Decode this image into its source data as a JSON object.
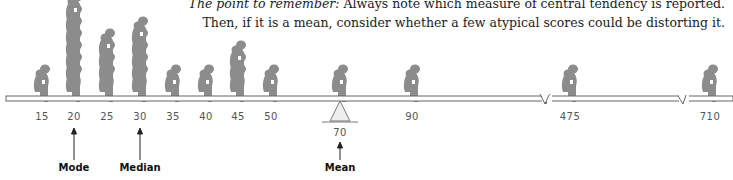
{
  "caption": {
    "line1_lead": "The point to remember:",
    "line1_rest": " Always note which measure of central tendency is reported.",
    "line2": "Then, if it is a mean, consider whether a few atypical scores could be distorting it."
  },
  "markers": {
    "mode": {
      "label": "Mode",
      "value": "20"
    },
    "median": {
      "label": "Median",
      "value": "30"
    },
    "mean": {
      "label": "Mean",
      "value": "70"
    }
  },
  "ticks": [
    "15",
    "20",
    "25",
    "30",
    "35",
    "40",
    "45",
    "50",
    "70",
    "90",
    "475",
    "710"
  ],
  "chart_data": {
    "type": "dot-plot",
    "categories": [
      "15",
      "20",
      "25",
      "30",
      "35",
      "40",
      "45",
      "50",
      "70",
      "90",
      "475",
      "710"
    ],
    "values": [
      1,
      7,
      4,
      5,
      1,
      1,
      3,
      1,
      1,
      1,
      1,
      1
    ],
    "annotations": [
      {
        "label": "Mode",
        "x": 20
      },
      {
        "label": "Median",
        "x": 30
      },
      {
        "label": "Mean",
        "x": 70
      }
    ],
    "axis_breaks": [
      "between 90 and 475",
      "between 475 and 710"
    ],
    "fulcrum_at": 70,
    "colors": {
      "figure": "#8c8c8c",
      "beam": "#ffffff",
      "fulcrum": "#eeeeee"
    }
  }
}
